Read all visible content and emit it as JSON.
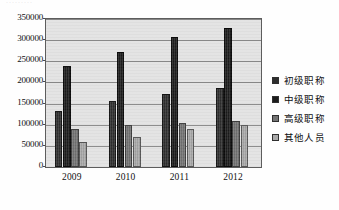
{
  "artifact": {
    "clipped_top_text": "·········",
    "type": "scanned-bar-chart"
  },
  "chart_data": {
    "type": "bar",
    "title": "",
    "subtitle": "",
    "xlabel": "",
    "ylabel": "",
    "categories": [
      "2009",
      "2010",
      "2011",
      "2012"
    ],
    "series": [
      {
        "name": "初级职称",
        "color": "#2e2e2e",
        "values": [
          132000,
          155000,
          173000,
          186000
        ]
      },
      {
        "name": "中级职称",
        "color": "#1c1c1c",
        "values": [
          240000,
          273000,
          308000,
          328000
        ]
      },
      {
        "name": "高级职称",
        "color": "#737373",
        "values": [
          89000,
          99000,
          105000,
          109000
        ]
      },
      {
        "name": "其他人员",
        "color": "#a9a9a9",
        "values": [
          58000,
          72000,
          89000,
          100000
        ]
      }
    ],
    "ylim": [
      0,
      350000
    ],
    "ytick_values": [
      0,
      50000,
      100000,
      150000,
      200000,
      250000,
      300000,
      350000
    ],
    "ytick_labels": [
      "0",
      "50000",
      "100000",
      "150000",
      "200000",
      "250000",
      "300000",
      "350000"
    ],
    "ytick_step": 50000,
    "grid": true,
    "grid_axis": "y",
    "legend_position": "right",
    "legend_entries": [
      "初级职称",
      "中级职称",
      "高级职称",
      "其他人员"
    ],
    "plot_background": "#e3e3e3",
    "frame": true
  }
}
